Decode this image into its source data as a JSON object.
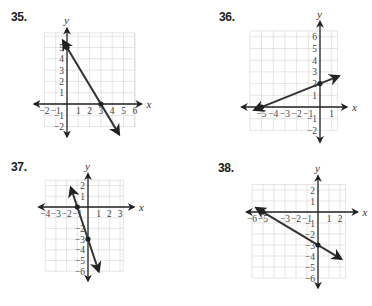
{
  "chart_data": [
    {
      "type": "line",
      "id": "35",
      "title": "35.",
      "xlabel": "x",
      "ylabel": "y",
      "xlim": [
        -2,
        6
      ],
      "ylim": [
        -2,
        6
      ],
      "x_ticks": [
        "-2",
        "-1",
        "1",
        "2",
        "3",
        "4",
        "5",
        "6"
      ],
      "y_ticks": [
        "5",
        "4",
        "3",
        "2",
        "1",
        "-1",
        "-2"
      ],
      "grid": true,
      "points": [
        {
          "x": 0,
          "y": 5
        },
        {
          "x": 3,
          "y": 0
        }
      ],
      "line": {
        "slope": -1.6667,
        "intercept": 5,
        "x_from": -0.35,
        "x_to": 4.6
      }
    },
    {
      "type": "line",
      "id": "36",
      "title": "36.",
      "xlabel": "x",
      "ylabel": "y",
      "xlim": [
        -6,
        1.5
      ],
      "ylim": [
        -2,
        6.5
      ],
      "x_ticks": [
        "-5",
        "-4",
        "-3",
        "-2",
        "-1",
        "1"
      ],
      "y_ticks": [
        "6",
        "5",
        "4",
        "3",
        "2",
        "1",
        "-1",
        "-2"
      ],
      "grid": true,
      "points": [
        {
          "x": -5,
          "y": 0
        },
        {
          "x": 0,
          "y": 2
        }
      ],
      "line": {
        "slope": 0.4,
        "intercept": 2,
        "x_from": -5.6,
        "x_to": 1.6
      }
    },
    {
      "type": "line",
      "id": "37",
      "title": "37.",
      "xlabel": "x",
      "ylabel": "y",
      "xlim": [
        -4,
        3.3
      ],
      "ylim": [
        -6,
        2.5
      ],
      "x_ticks": [
        "-4",
        "-3",
        "-2",
        "-1",
        "1",
        "2",
        "3"
      ],
      "y_ticks": [
        "2",
        "1",
        "-2",
        "-3",
        "-4",
        "-5",
        "-6"
      ],
      "grid": true,
      "points": [
        {
          "x": -1,
          "y": 0
        },
        {
          "x": 0,
          "y": -3
        }
      ],
      "line": {
        "slope": -3,
        "intercept": -3,
        "x_from": -1.6,
        "x_to": 1.0
      }
    },
    {
      "type": "line",
      "id": "38",
      "title": "38.",
      "xlabel": "x",
      "ylabel": "y",
      "xlim": [
        -6,
        2.5
      ],
      "ylim": [
        -6,
        2.5
      ],
      "x_ticks": [
        "-6",
        "-5",
        "-3",
        "-2",
        "-1",
        "1",
        "2"
      ],
      "y_ticks": [
        "2",
        "1",
        "-1",
        "-2",
        "-3",
        "-4",
        "-5",
        "-6"
      ],
      "grid": true,
      "points": [
        {
          "x": -5,
          "y": 0
        },
        {
          "x": 0,
          "y": -3
        }
      ],
      "line": {
        "slope": -0.6,
        "intercept": -3,
        "x_from": -5.6,
        "x_to": 2.1
      }
    }
  ],
  "panels": [
    {
      "number": "35.",
      "x_label": "x",
      "y_label": "y"
    },
    {
      "number": "36.",
      "x_label": "x",
      "y_label": "y"
    },
    {
      "number": "37.",
      "x_label": "x",
      "y_label": "y"
    },
    {
      "number": "38.",
      "x_label": "x",
      "y_label": "y"
    }
  ]
}
